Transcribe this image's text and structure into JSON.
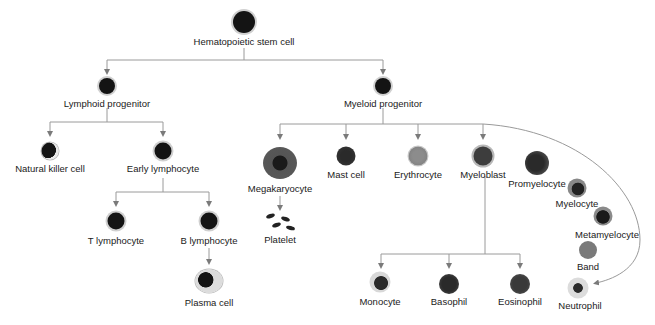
{
  "colors": {
    "line": "#8a8a8a",
    "arrow": "#7a7a7a",
    "nucleus": "#141414",
    "halo": "#cfcfcf"
  },
  "nodes": {
    "stem": {
      "label": "Hematopoietic stem cell"
    },
    "lymphoid": {
      "label": "Lymphoid progenitor"
    },
    "myeloid": {
      "label": "Myeloid progenitor"
    },
    "nk": {
      "label": "Natural killer cell"
    },
    "early_lymph": {
      "label": "Early lymphocyte"
    },
    "t_lymph": {
      "label": "T lymphocyte"
    },
    "b_lymph": {
      "label": "B lymphocyte"
    },
    "plasma": {
      "label": "Plasma cell"
    },
    "megakaryocyte": {
      "label": "Megakaryocyte"
    },
    "platelet": {
      "label": "Platelet"
    },
    "mast": {
      "label": "Mast cell"
    },
    "erythrocyte": {
      "label": "Erythrocyte"
    },
    "myeloblast": {
      "label": "Myeloblast"
    },
    "promyelocyte": {
      "label": "Promyelocyte"
    },
    "myelocyte": {
      "label": "Myelocyte"
    },
    "metamyelocyte": {
      "label": "Metamyelocyte"
    },
    "band": {
      "label": "Band"
    },
    "neutrophil": {
      "label": "Neutrophil"
    },
    "monocyte": {
      "label": "Monocyte"
    },
    "basophil": {
      "label": "Basophil"
    },
    "eosinophil": {
      "label": "Eosinophil"
    }
  }
}
